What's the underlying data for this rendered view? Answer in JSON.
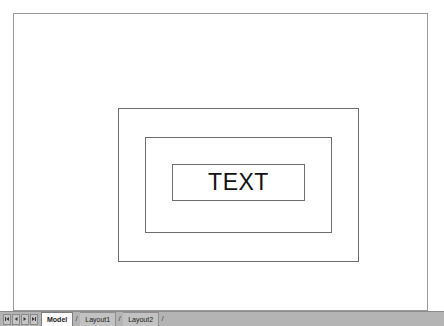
{
  "window": {
    "app_kind": "cad-drawing-view"
  },
  "canvas": {
    "background_color": "#ffffff",
    "page_border_color": "#9a9a9a",
    "entity_color": "#6e6e6e",
    "shapes": [
      {
        "name": "outer-rectangle",
        "label": ""
      },
      {
        "name": "middle-rectangle",
        "label": ""
      },
      {
        "name": "inner-rectangle",
        "label": ""
      }
    ],
    "text_entity": {
      "value": "TEXT",
      "color": "#111111"
    }
  },
  "tab_bar": {
    "background_color": "#b4b4b4",
    "nav_buttons": [
      {
        "name": "first-layout-button",
        "glyph": "first"
      },
      {
        "name": "previous-layout-button",
        "glyph": "previous"
      },
      {
        "name": "next-layout-button",
        "glyph": "next"
      },
      {
        "name": "last-layout-button",
        "glyph": "last"
      }
    ],
    "separator": "/",
    "tabs": [
      {
        "label": "Model",
        "active": true
      },
      {
        "label": "Layout1",
        "active": false
      },
      {
        "label": "Layout2",
        "active": false
      }
    ]
  }
}
